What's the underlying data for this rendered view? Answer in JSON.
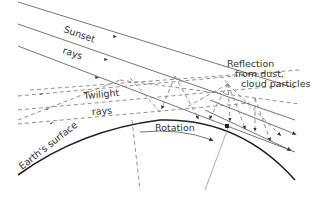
{
  "diagram": {
    "type": "twilight-illumination-diagram",
    "labels": {
      "sunset": "Sunset",
      "rays_top": "rays",
      "twilight": "Twilight",
      "rays_bottom": "rays",
      "reflection_line1": "Reflection",
      "reflection_line2": "from dust,",
      "reflection_line3": "cloud particles",
      "rotation": "Rotation",
      "earth_surface": "Earth's surface"
    },
    "elements": [
      {
        "kind": "solid-ray",
        "meaning": "sunset rays"
      },
      {
        "kind": "dashed-ray",
        "meaning": "twilight rays"
      },
      {
        "kind": "curve",
        "meaning": "earth surface"
      },
      {
        "kind": "arrow",
        "meaning": "rotation"
      },
      {
        "kind": "point",
        "meaning": "observer"
      }
    ],
    "colors": {
      "line": "#666666",
      "earth": "#222222",
      "text": "#333333"
    }
  }
}
